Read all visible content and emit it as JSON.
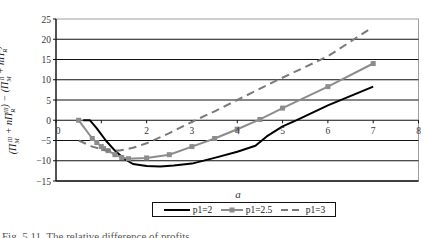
{
  "chart_data": {
    "type": "line",
    "title": "",
    "xlabel": "a",
    "ylabel": "(Π_M^III + nΠ_R^III) − (Π_M^II + nΠ_R^II)",
    "xlim": [
      0,
      8
    ],
    "ylim": [
      -15,
      25
    ],
    "xticks": [
      "0",
      "2",
      "3",
      "4",
      "5",
      "6",
      "7",
      "8"
    ],
    "yticks": [
      "25",
      "20",
      "15",
      "10",
      "5",
      "0",
      "-5",
      "-10",
      "-15"
    ],
    "grid": "horizontal",
    "legend_position": "bottom",
    "series": [
      {
        "name": "p1=2",
        "style": "solid-black",
        "color": "#000000",
        "x": [
          0.6,
          0.75,
          0.9,
          1.1,
          1.3,
          1.5,
          1.7,
          2.0,
          2.3,
          2.6,
          3.0,
          3.5,
          4.0,
          4.4,
          4.65,
          5.0,
          5.3,
          6.0,
          7.0
        ],
        "y": [
          0,
          0,
          -2,
          -5,
          -7.5,
          -9.5,
          -10.8,
          -11.3,
          -11.4,
          -11.2,
          -10.7,
          -9.3,
          -7.8,
          -6.3,
          -4,
          -1.5,
          0,
          3.7,
          8.3
        ]
      },
      {
        "name": "p1=2.5",
        "style": "gray-square-markers",
        "color": "#8c8c8c",
        "x": [
          0.5,
          0.8,
          0.9,
          1.0,
          1.05,
          1.15,
          1.3,
          1.45,
          1.6,
          2.0,
          2.5,
          3.0,
          3.5,
          4.0,
          4.5,
          5.0,
          6.0,
          7.0
        ],
        "y": [
          0,
          -4.5,
          -5.5,
          -6.5,
          -7,
          -7.5,
          -8.5,
          -9.2,
          -9.5,
          -9.3,
          -8.5,
          -6.5,
          -4.5,
          -2.2,
          0.2,
          3.0,
          8.3,
          14.0
        ]
      },
      {
        "name": "p1=3",
        "style": "gray-dashed",
        "color": "#7a7a7a",
        "x": [
          0.5,
          0.8,
          1.1,
          1.4,
          1.7,
          2.0,
          2.5,
          3.07,
          3.5,
          4.0,
          4.9,
          6.0,
          6.95
        ],
        "y": [
          -5,
          -6.5,
          -7.5,
          -7.5,
          -6.8,
          -5.7,
          -3.2,
          0,
          2.2,
          5.0,
          10.0,
          15.8,
          22.7
        ]
      }
    ]
  },
  "legend": [
    {
      "label": "p1=2"
    },
    {
      "label": "p1=2.5"
    },
    {
      "label": "p1=3"
    }
  ],
  "caption": "Fig. 5.11. The relative difference of profits"
}
